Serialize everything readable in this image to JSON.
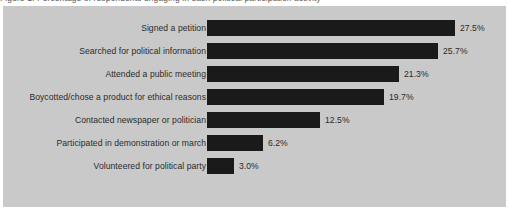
{
  "caption": {
    "text": "Figure 1: Percentage of respondents engaging in each political participation activity"
  },
  "colors": {
    "panel_background": "#c9c9c9",
    "bar_fill": "#1a1a1a",
    "text": "#2b2b2b",
    "page_background": "#ffffff"
  },
  "chart_data": {
    "type": "bar",
    "orientation": "horizontal",
    "title": "",
    "xlabel": "",
    "ylabel": "",
    "xlim": [
      0,
      30
    ],
    "grid": false,
    "legend": null,
    "value_suffix": "%",
    "categories": [
      "Signed a petition",
      "Searched for political information",
      "Attended a public meeting",
      "Boycotted/chose a product for ethical reasons",
      "Contacted newspaper or politician",
      "Participated in demonstration or march",
      "Volunteered for political party"
    ],
    "values": [
      27.5,
      25.7,
      21.3,
      19.7,
      12.5,
      6.2,
      3.0
    ],
    "value_labels": [
      "27.5%",
      "25.7%",
      "21.3%",
      "19.7%",
      "12.5%",
      "6.2%",
      "3.0%"
    ]
  }
}
